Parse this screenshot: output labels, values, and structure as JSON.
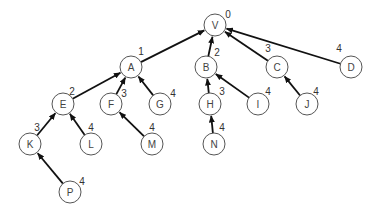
{
  "diagram": {
    "type": "rooted-tree",
    "node_radius": 11,
    "nodes": [
      {
        "id": "V",
        "x": 215,
        "y": 25,
        "depth": "0",
        "dx": 228,
        "dy": 14
      },
      {
        "id": "A",
        "x": 131,
        "y": 67,
        "depth": "1",
        "dx": 141,
        "dy": 51
      },
      {
        "id": "B",
        "x": 206,
        "y": 67,
        "depth": "2",
        "dx": 217,
        "dy": 52
      },
      {
        "id": "C",
        "x": 277,
        "y": 67,
        "depth": "3",
        "dx": 268,
        "dy": 48
      },
      {
        "id": "D",
        "x": 351,
        "y": 67,
        "depth": "4",
        "dx": 339,
        "dy": 48
      },
      {
        "id": "E",
        "x": 63,
        "y": 104,
        "depth": "2",
        "dx": 72,
        "dy": 91
      },
      {
        "id": "F",
        "x": 111,
        "y": 104,
        "depth": "3",
        "dx": 124,
        "dy": 93
      },
      {
        "id": "G",
        "x": 160,
        "y": 104,
        "depth": "4",
        "dx": 173,
        "dy": 93
      },
      {
        "id": "H",
        "x": 210,
        "y": 104,
        "depth": "3",
        "dx": 222,
        "dy": 91
      },
      {
        "id": "I",
        "x": 258,
        "y": 104,
        "depth": "4",
        "dx": 268,
        "dy": 91
      },
      {
        "id": "J",
        "x": 307,
        "y": 104,
        "depth": "4",
        "dx": 316,
        "dy": 91
      },
      {
        "id": "K",
        "x": 30,
        "y": 144,
        "depth": "3",
        "dx": 37,
        "dy": 127
      },
      {
        "id": "L",
        "x": 91,
        "y": 144,
        "depth": "4",
        "dx": 91,
        "dy": 127
      },
      {
        "id": "M",
        "x": 152,
        "y": 144,
        "depth": "4",
        "dx": 152,
        "dy": 127
      },
      {
        "id": "N",
        "x": 214,
        "y": 144,
        "depth": "4",
        "dx": 222,
        "dy": 127
      },
      {
        "id": "P",
        "x": 70,
        "y": 192,
        "depth": "4",
        "dx": 82,
        "dy": 181
      }
    ],
    "edges": [
      {
        "from": "A",
        "to": "V"
      },
      {
        "from": "B",
        "to": "V"
      },
      {
        "from": "C",
        "to": "V"
      },
      {
        "from": "D",
        "to": "V"
      },
      {
        "from": "E",
        "to": "A"
      },
      {
        "from": "F",
        "to": "A"
      },
      {
        "from": "G",
        "to": "A"
      },
      {
        "from": "H",
        "to": "B"
      },
      {
        "from": "I",
        "to": "B"
      },
      {
        "from": "J",
        "to": "C"
      },
      {
        "from": "K",
        "to": "E"
      },
      {
        "from": "L",
        "to": "E"
      },
      {
        "from": "M",
        "to": "F"
      },
      {
        "from": "N",
        "to": "H"
      },
      {
        "from": "P",
        "to": "K"
      }
    ],
    "colors": {
      "edge": "#111111",
      "node_stroke": "#555555",
      "node_fill": "#ffffff",
      "text": "#444444"
    }
  }
}
